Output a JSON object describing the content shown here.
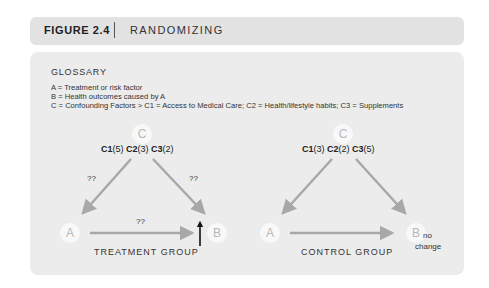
{
  "header": {
    "figure_number": "FIGURE 2.4",
    "title": "RANDOMIZING"
  },
  "glossary": {
    "title": "GLOSSARY",
    "items": [
      "A = Treatment or risk factor",
      "B = Health outcomes caused by A",
      "C = Confounding Factors  > C1 = Access to Medical Care; C2 = Health/lifestyle habits; C3 = Supplements"
    ]
  },
  "diagrams": [
    {
      "group_label": "TREATMENT GROUP",
      "node_c": "C",
      "node_a": "A",
      "node_b": "B",
      "factors": [
        {
          "name": "C1",
          "value": "(5)"
        },
        {
          "name": "C2",
          "value": "(3)"
        },
        {
          "name": "C3",
          "value": "(2)"
        }
      ],
      "edge_labels": {
        "c_to_a": "??",
        "c_to_b": "??",
        "a_to_b": "??"
      },
      "b_indicator": "up-arrow"
    },
    {
      "group_label": "CONTROL GROUP",
      "node_c": "C",
      "node_a": "A",
      "node_b": "B",
      "factors": [
        {
          "name": "C1",
          "value": "(3)"
        },
        {
          "name": "C2",
          "value": "(2)"
        },
        {
          "name": "C3",
          "value": "(5)"
        }
      ],
      "b_note_line1": "no",
      "b_note_line2": "change"
    }
  ],
  "colors": {
    "header_bg": "#e2e2e2",
    "panel_bg": "#ececec",
    "arrow": "#a8a8a8",
    "node_text": "#b8b8b8"
  }
}
